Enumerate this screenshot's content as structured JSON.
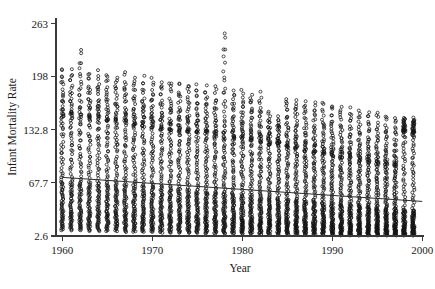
{
  "chart_data": {
    "type": "scatter",
    "title": "",
    "xlabel": "Year",
    "ylabel": "Infant Mortality Rate",
    "xlim": [
      1959.3,
      2000.2
    ],
    "ylim": [
      2.6,
      270
    ],
    "grid": false,
    "legend": null,
    "xticks": [
      1960,
      1970,
      1980,
      1990,
      2000
    ],
    "xtick_labels": [
      "1960",
      "1970",
      "1980",
      "1990",
      "2000"
    ],
    "yticks": [
      2.6,
      67.7,
      132.8,
      198,
      263
    ],
    "ytick_labels": [
      "2.6",
      "67.7",
      "132.8",
      "198",
      "263"
    ],
    "marker": "open-circle",
    "marker_color": "#141414",
    "trend_line": {
      "label": "trend",
      "x": [
        1960,
        2000
      ],
      "y": [
        74.5,
        45.0
      ],
      "color": "#2b2b2b"
    },
    "annotations": [
      {
        "text": "high outlier near 1978",
        "x": 1978,
        "y": 256
      }
    ],
    "series": [
      {
        "name": "Infant Mortality Rate by Year",
        "year_columns": [
          {
            "year": 1960,
            "n": 96,
            "min": 9,
            "max": 210,
            "median": 72,
            "q1": 36,
            "q3": 150
          },
          {
            "year": 1961,
            "n": 96,
            "min": 9,
            "max": 208,
            "median": 71,
            "q1": 35,
            "q3": 149
          },
          {
            "year": 1962,
            "n": 97,
            "min": 9,
            "max": 233,
            "median": 70,
            "q1": 35,
            "q3": 148
          },
          {
            "year": 1963,
            "n": 97,
            "min": 8,
            "max": 206,
            "median": 70,
            "q1": 34,
            "q3": 147
          },
          {
            "year": 1964,
            "n": 98,
            "min": 8,
            "max": 205,
            "median": 69,
            "q1": 34,
            "q3": 146
          },
          {
            "year": 1965,
            "n": 99,
            "min": 8,
            "max": 204,
            "median": 68,
            "q1": 33,
            "q3": 145
          },
          {
            "year": 1966,
            "n": 99,
            "min": 8,
            "max": 200,
            "median": 68,
            "q1": 33,
            "q3": 143
          },
          {
            "year": 1967,
            "n": 100,
            "min": 7,
            "max": 205,
            "median": 67,
            "q1": 32,
            "q3": 142
          },
          {
            "year": 1968,
            "n": 100,
            "min": 7,
            "max": 199,
            "median": 66,
            "q1": 32,
            "q3": 140
          },
          {
            "year": 1969,
            "n": 101,
            "min": 7,
            "max": 198,
            "median": 65,
            "q1": 31,
            "q3": 139
          },
          {
            "year": 1970,
            "n": 102,
            "min": 7,
            "max": 196,
            "median": 64,
            "q1": 30,
            "q3": 137
          },
          {
            "year": 1971,
            "n": 102,
            "min": 6,
            "max": 194,
            "median": 63,
            "q1": 30,
            "q3": 135
          },
          {
            "year": 1972,
            "n": 103,
            "min": 6,
            "max": 193,
            "median": 62,
            "q1": 29,
            "q3": 134
          },
          {
            "year": 1973,
            "n": 103,
            "min": 6,
            "max": 191,
            "median": 61,
            "q1": 29,
            "q3": 132
          },
          {
            "year": 1974,
            "n": 104,
            "min": 6,
            "max": 190,
            "median": 60,
            "q1": 28,
            "q3": 131
          },
          {
            "year": 1975,
            "n": 104,
            "min": 6,
            "max": 188,
            "median": 59,
            "q1": 27,
            "q3": 129
          },
          {
            "year": 1976,
            "n": 105,
            "min": 5,
            "max": 187,
            "median": 58,
            "q1": 27,
            "q3": 128
          },
          {
            "year": 1977,
            "n": 105,
            "min": 5,
            "max": 185,
            "median": 57,
            "q1": 26,
            "q3": 126
          },
          {
            "year": 1978,
            "n": 106,
            "min": 5,
            "max": 256,
            "median": 56,
            "q1": 26,
            "q3": 125
          },
          {
            "year": 1979,
            "n": 106,
            "min": 5,
            "max": 183,
            "median": 55,
            "q1": 25,
            "q3": 123
          },
          {
            "year": 1980,
            "n": 107,
            "min": 5,
            "max": 181,
            "median": 54,
            "q1": 24,
            "q3": 122
          },
          {
            "year": 1981,
            "n": 107,
            "min": 5,
            "max": 180,
            "median": 53,
            "q1": 24,
            "q3": 120
          },
          {
            "year": 1982,
            "n": 108,
            "min": 4,
            "max": 178,
            "median": 52,
            "q1": 23,
            "q3": 118
          },
          {
            "year": 1983,
            "n": 108,
            "min": 4,
            "max": 155,
            "median": 51,
            "q1": 23,
            "q3": 116
          },
          {
            "year": 1984,
            "n": 109,
            "min": 4,
            "max": 150,
            "median": 50,
            "q1": 22,
            "q3": 114
          },
          {
            "year": 1985,
            "n": 109,
            "min": 4,
            "max": 175,
            "median": 49,
            "q1": 22,
            "q3": 112
          },
          {
            "year": 1986,
            "n": 110,
            "min": 4,
            "max": 173,
            "median": 48,
            "q1": 21,
            "q3": 110
          },
          {
            "year": 1987,
            "n": 110,
            "min": 4,
            "max": 171,
            "median": 47,
            "q1": 21,
            "q3": 108
          },
          {
            "year": 1988,
            "n": 111,
            "min": 4,
            "max": 169,
            "median": 46,
            "q1": 20,
            "q3": 106
          },
          {
            "year": 1989,
            "n": 111,
            "min": 4,
            "max": 167,
            "median": 45,
            "q1": 20,
            "q3": 104
          },
          {
            "year": 1990,
            "n": 112,
            "min": 4,
            "max": 165,
            "median": 44,
            "q1": 19,
            "q3": 102
          },
          {
            "year": 1991,
            "n": 112,
            "min": 3,
            "max": 163,
            "median": 43,
            "q1": 19,
            "q3": 100
          },
          {
            "year": 1992,
            "n": 113,
            "min": 3,
            "max": 161,
            "median": 42,
            "q1": 18,
            "q3": 98
          },
          {
            "year": 1993,
            "n": 113,
            "min": 3,
            "max": 159,
            "median": 41,
            "q1": 18,
            "q3": 96
          },
          {
            "year": 1994,
            "n": 114,
            "min": 3,
            "max": 157,
            "median": 40,
            "q1": 17,
            "q3": 94
          },
          {
            "year": 1995,
            "n": 114,
            "min": 3,
            "max": 155,
            "median": 39,
            "q1": 17,
            "q3": 92
          },
          {
            "year": 1996,
            "n": 115,
            "min": 3,
            "max": 153,
            "median": 38,
            "q1": 16,
            "q3": 90
          },
          {
            "year": 1997,
            "n": 115,
            "min": 3,
            "max": 151,
            "median": 37,
            "q1": 16,
            "q3": 88
          },
          {
            "year": 1998,
            "n": 116,
            "min": 3,
            "max": 149,
            "median": 36,
            "q1": 15,
            "q3": 130
          },
          {
            "year": 1999,
            "n": 116,
            "min": 3,
            "max": 147,
            "median": 35,
            "q1": 15,
            "q3": 128
          }
        ]
      }
    ]
  }
}
